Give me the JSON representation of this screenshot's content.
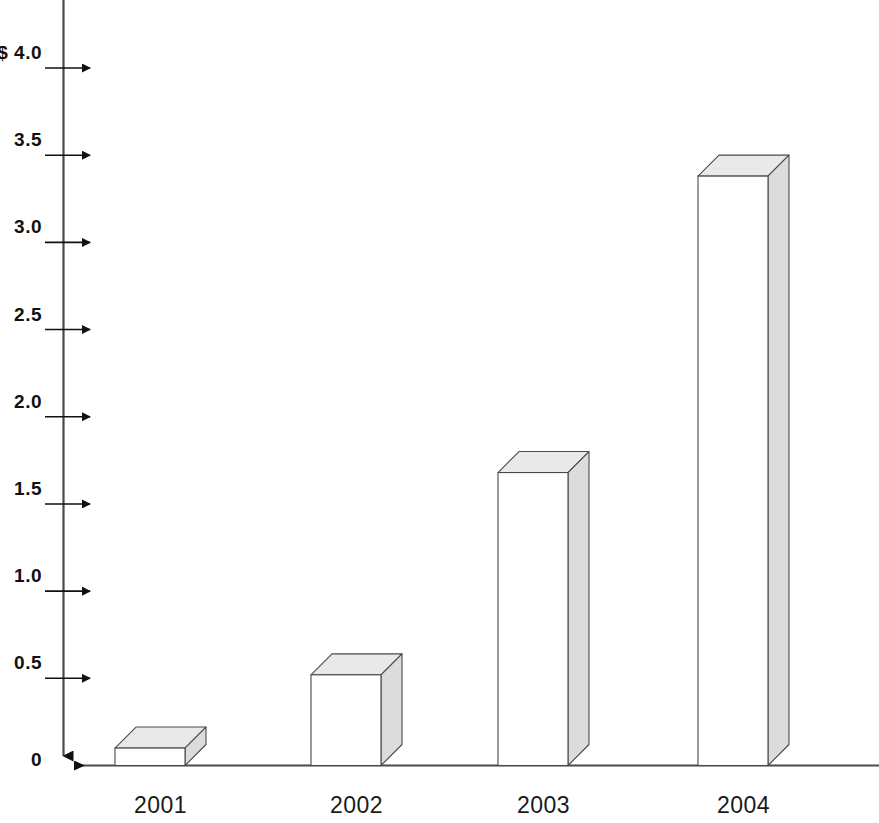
{
  "chart_data": {
    "type": "bar",
    "title": "",
    "subtitle": "",
    "xlabel": "",
    "ylabel": "",
    "categories": [
      "2001",
      "2002",
      "2003",
      "2004"
    ],
    "values": [
      0.1,
      0.52,
      1.68,
      3.38
    ],
    "ylim": [
      0,
      4.0
    ],
    "ytick_values": [
      4.0,
      3.5,
      3.0,
      2.5,
      2.0,
      1.5,
      1.0,
      0.5,
      0
    ],
    "ytick_labels": [
      "$ 4.0",
      "3.5",
      "3.0",
      "2.5",
      "2.0",
      "1.5",
      "1.0",
      "0.5",
      "0"
    ],
    "grid": false,
    "legend": null,
    "style": {
      "bar_style": "3d-box",
      "bar_front_fill": "#ffffff",
      "bar_top_fill": "#e9e9e9",
      "bar_side_fill": "#dcdcdc",
      "bar_stroke": "#4a4a4a",
      "axis_color": "#2b2b2b",
      "tick_arrow_color": "#111111",
      "background": "#ffffff"
    }
  },
  "axes": {
    "y_axis_name": "y-axis",
    "x_axis_name": "x-axis",
    "y_axis_arrow": "down-arrow",
    "x_axis_arrow": "left-arrow"
  }
}
